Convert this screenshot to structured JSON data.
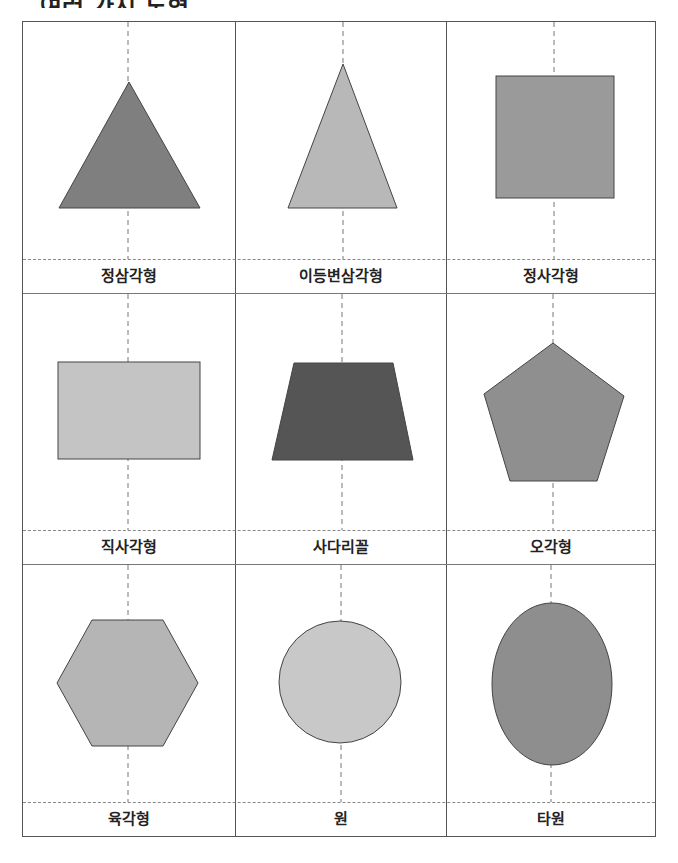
{
  "page": {
    "title": "여러 가지 도형"
  },
  "cards": [
    {
      "label": "정삼각형",
      "shape": "equilateral-triangle",
      "fill": "#7f7f7f"
    },
    {
      "label": "이등변삼각형",
      "shape": "isosceles-triangle",
      "fill": "#b8b8b8"
    },
    {
      "label": "정사각형",
      "shape": "square",
      "fill": "#9a9a9a"
    },
    {
      "label": "직사각형",
      "shape": "rectangle",
      "fill": "#c4c4c4"
    },
    {
      "label": "사다리꼴",
      "shape": "trapezoid",
      "fill": "#555555"
    },
    {
      "label": "오각형",
      "shape": "pentagon",
      "fill": "#8f8f8f"
    },
    {
      "label": "육각형",
      "shape": "hexagon",
      "fill": "#b5b5b5"
    },
    {
      "label": "원",
      "shape": "circle",
      "fill": "#c8c8c8"
    },
    {
      "label": "타원",
      "shape": "ellipse",
      "fill": "#8e8e8e"
    }
  ],
  "colors": {
    "border": "#555555",
    "stroke": "#444444",
    "fold_line": "#777777"
  }
}
